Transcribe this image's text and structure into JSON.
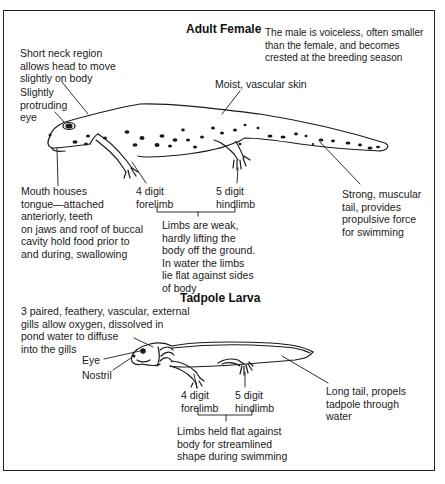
{
  "adult": {
    "title": "Adult Female",
    "male_note": "The male is voiceless, often smaller\nthan the female, and becomes\ncrested at the breeding season",
    "labels": {
      "neck": "Short neck region\nallows head to move\nslightly on body",
      "eye": "Slightly\nprotruding\neye",
      "skin": "Moist, vascular skin",
      "mouth": "Mouth houses\ntongue—attached\nanteriorly, teeth\non jaws and roof of buccal\ncavity hold food prior to\nand during, swallowing",
      "forelimb": "4 digit\nforelimb",
      "hindlimb": "5 digit\nhindlimb",
      "limbs_note": "Limbs are weak,\nhardly lifting the\nbody off the ground.\nIn water the limbs\nlie flat against sides\nof body",
      "tail": "Strong, muscular\ntail, provides\npropulsive force\nfor swimming"
    }
  },
  "larva": {
    "title": "Tadpole Larva",
    "labels": {
      "gills": "3 paired, feathery, vascular, external\ngills allow oxygen, dissolved in\npond water to diffuse\ninto the gills",
      "eye": "Eye",
      "nostril": "Nostril",
      "forelimb": "4 digit\nforelimb",
      "hindlimb": "5 digit\nhindlimb",
      "limbs_note": "Limbs held flat against\nbody for streamlined\nshape during swimming",
      "tail": "Long tail, propels\ntadpole through\nwater"
    }
  },
  "colors": {
    "ink": "#1a1a1a",
    "background": "#ffffff"
  }
}
